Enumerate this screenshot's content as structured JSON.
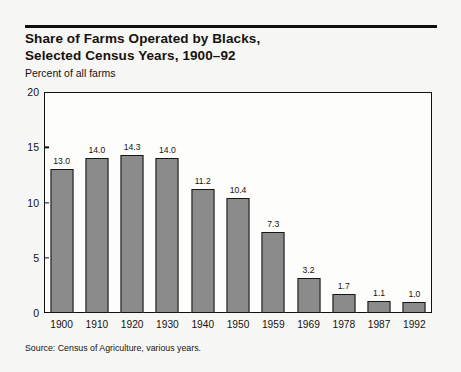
{
  "figure": {
    "title_lines": [
      "Share of Farms Operated by Blacks,",
      "Selected Census Years, 1900–92"
    ],
    "subtitle": "Percent of all farms",
    "source": "Source: Census of Agriculture, various years."
  },
  "chart_data": {
    "type": "bar",
    "title": "Share of Farms Operated by Blacks, Selected Census Years, 1900–92",
    "subtitle": "Percent of all farms",
    "xlabel": "",
    "ylabel": "Percent of all farms",
    "ylim": [
      0,
      20
    ],
    "yticks": [
      0,
      5,
      10,
      15,
      20
    ],
    "ytick_labels": [
      "0",
      "5",
      "10",
      "15",
      "20"
    ],
    "grid": false,
    "legend": false,
    "categories": [
      "1900",
      "1910",
      "1920",
      "1930",
      "1940",
      "1950",
      "1959",
      "1969",
      "1978",
      "1987",
      "1992"
    ],
    "values": [
      13.0,
      14.0,
      14.3,
      14.0,
      11.2,
      10.4,
      7.3,
      3.2,
      1.7,
      1.1,
      1.0
    ],
    "value_labels": [
      "13.0",
      "14.0",
      "14.3",
      "14.0",
      "11.2",
      "10.4",
      "7.3",
      "3.2",
      "1.7",
      "1.1",
      "1.0"
    ],
    "source": "Source: Census of Agriculture, various years.",
    "colors": {
      "bar_fill": "#8b8b8b",
      "bar_edge": "#171614",
      "axis": "#121110",
      "background": "#f7f7f5",
      "plot_background": "#fdfdfc",
      "text": "#15120f"
    }
  }
}
